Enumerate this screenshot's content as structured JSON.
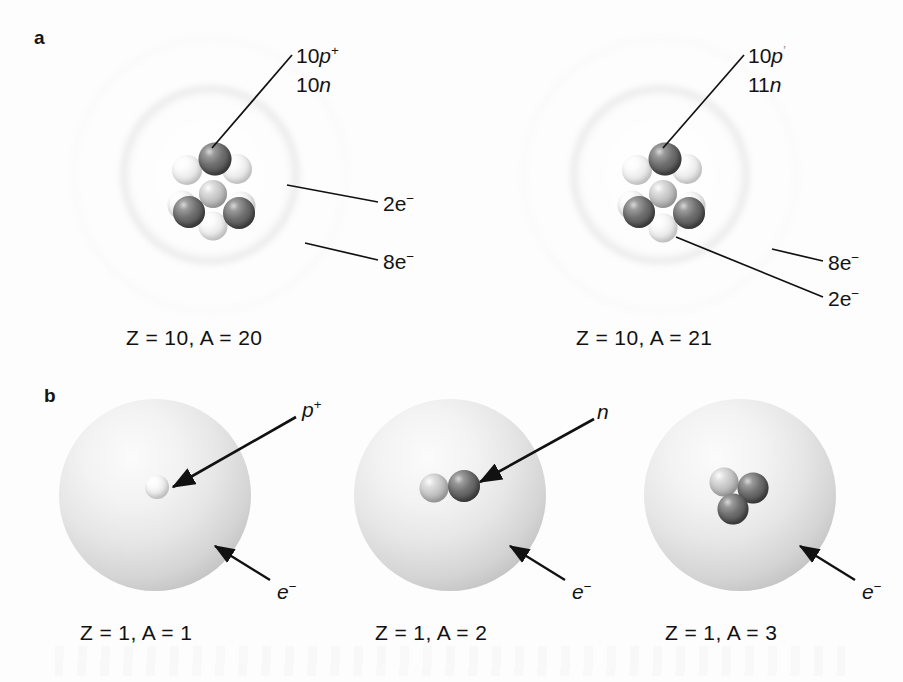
{
  "figure": {
    "background_color": "#fdfdfd",
    "width": 903,
    "height": 682
  },
  "panels": [
    {
      "letter": "a",
      "description": "Bohr shell models of two neon isotopes",
      "atoms": [
        {
          "name": "neon-20",
          "caption": "Z = 10, A = 20",
          "center": {
            "x": 210,
            "y": 175
          },
          "nucleus_label_lines": [
            "10p",
            "10n"
          ],
          "nucleus_label_html": "10<span class=\"it\">p</span><sup>+</sup>",
          "nucleus_label_html_2": "10<span class=\"it\">n</span>",
          "shells": [
            {
              "label": "2e",
              "charge": "−",
              "electrons": 2
            },
            {
              "label": "8e",
              "charge": "−",
              "electrons": 8
            }
          ],
          "protons": 10,
          "neutrons": 10
        },
        {
          "name": "neon-21",
          "caption": "Z = 10, A = 21",
          "center": {
            "x": 660,
            "y": 175
          },
          "nucleus_label_lines": [
            "10p",
            "11n"
          ],
          "nucleus_label_html": "10<span class=\"it\">p</span><sup>+</sup>",
          "nucleus_label_html_2": "11<span class=\"it\">n</span>",
          "shells": [
            {
              "label": "8e",
              "charge": "−",
              "electrons": 8
            },
            {
              "label": "2e",
              "charge": "−",
              "electrons": 2
            }
          ],
          "protons": 10,
          "neutrons": 11
        }
      ]
    },
    {
      "letter": "b",
      "description": "Electron cloud models of three hydrogen isotopes",
      "atoms": [
        {
          "name": "protium",
          "caption": "Z = 1, A = 1",
          "center": {
            "x": 155,
            "y": 495
          },
          "nucleon_label": "p",
          "nucleon_charge": "+",
          "cloud_label": "e",
          "cloud_charge": "−",
          "protons": 1,
          "neutrons": 0
        },
        {
          "name": "deuterium",
          "caption": "Z = 1, A = 2",
          "center": {
            "x": 450,
            "y": 495
          },
          "nucleon_label": "n",
          "nucleon_charge": "",
          "cloud_label": "e",
          "cloud_charge": "−",
          "protons": 1,
          "neutrons": 1
        },
        {
          "name": "tritium",
          "caption": "Z = 1, A = 3",
          "center": {
            "x": 740,
            "y": 495
          },
          "nucleon_label": "",
          "nucleon_charge": "",
          "cloud_label": "e",
          "cloud_charge": "−",
          "protons": 1,
          "neutrons": 2
        }
      ]
    }
  ],
  "labels": {
    "panel_a_letter": "a",
    "panel_b_letter": "b",
    "ne20_proton_count": "10",
    "ne20_proton_symbol": "p",
    "ne20_proton_sign": "+",
    "ne20_neutron_count": "10",
    "ne20_neutron_symbol": "n",
    "ne20_shell_inner": "2e",
    "ne20_shell_inner_sign": "−",
    "ne20_shell_outer": "8e",
    "ne20_shell_outer_sign": "−",
    "ne20_caption": "Z = 10, A = 20",
    "ne21_proton_count": "10",
    "ne21_proton_symbol": "p",
    "ne21_proton_sign": "’",
    "ne21_neutron_count": "11",
    "ne21_neutron_symbol": "n",
    "ne21_shell_outer": "8e",
    "ne21_shell_outer_sign": "−",
    "ne21_shell_inner": "2e",
    "ne21_shell_inner_sign": "−",
    "ne21_caption": "Z = 10, A = 21",
    "h1_proton_symbol": "p",
    "h1_proton_sign": "+",
    "h1_electron_symbol": "e",
    "h1_electron_sign": "−",
    "h1_caption": "Z = 1, A = 1",
    "h2_neutron_symbol": "n",
    "h2_electron_symbol": "e",
    "h2_electron_sign": "−",
    "h2_caption": "Z = 1, A = 2",
    "h3_electron_symbol": "e",
    "h3_electron_sign": "−",
    "h3_caption": "Z = 1, A = 3"
  },
  "colors": {
    "background": "#fdfdfd",
    "text": "#131313",
    "neutron_dark": "#6e6e6e",
    "proton_light": "#ebebeb",
    "shell_gray": "#6c6c6c",
    "cloud_gray": "#d4d4d4",
    "leader_line": "#111111"
  }
}
